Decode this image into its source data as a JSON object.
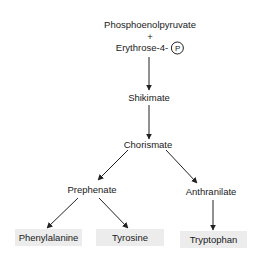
{
  "diagram": {
    "nodes": {
      "pep": "Phosphoenolpyruvate",
      "plus": "+",
      "e4p": "Erythrose-4-",
      "phosphate": "P",
      "shikimate": "Shikimate",
      "chorismate": "Chorismate",
      "prephenate": "Prephenate",
      "anthranilate": "Anthranilate",
      "phenylalanine": "Phenylalanine",
      "tyrosine": "Tyrosine",
      "tryptophan": "Tryptophan"
    },
    "edges": [
      {
        "from": "Phosphoenolpyruvate + Erythrose-4-P",
        "to": "Shikimate"
      },
      {
        "from": "Shikimate",
        "to": "Chorismate"
      },
      {
        "from": "Chorismate",
        "to": "Prephenate"
      },
      {
        "from": "Chorismate",
        "to": "Anthranilate"
      },
      {
        "from": "Prephenate",
        "to": "Phenylalanine"
      },
      {
        "from": "Prephenate",
        "to": "Tyrosine"
      },
      {
        "from": "Anthranilate",
        "to": "Tryptophan"
      }
    ],
    "colors": {
      "text": "#1a1a1a",
      "arrow": "#222222",
      "product_box": "#ececec"
    }
  }
}
